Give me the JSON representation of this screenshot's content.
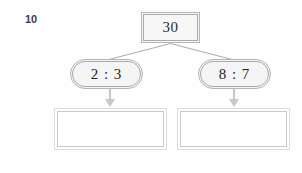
{
  "page": {
    "background_color": "#fefefe",
    "question_number": "10"
  },
  "diagram": {
    "type": "ratio-split-tree",
    "total_node": {
      "label": "30",
      "shape": "rectangle",
      "fill_color": "#f7f7f7",
      "border_color": "#b6b6b6"
    },
    "branches": [
      {
        "id": "left",
        "ratio_label": "2 : 3",
        "shape": "rounded-pill",
        "fill_color": "#f5f5f5",
        "border_color": "#b4b4b4",
        "arrow": "down-arrow-icon",
        "arrow_color": "#c8c8c8",
        "answer_label": "",
        "answer_placeholder": ""
      },
      {
        "id": "right",
        "ratio_label": "8 : 7",
        "shape": "rounded-pill",
        "fill_color": "#f5f5f5",
        "border_color": "#b4b4b4",
        "arrow": "down-arrow-icon",
        "arrow_color": "#c8c8c8",
        "answer_label": "",
        "answer_placeholder": ""
      }
    ],
    "connector_color": "#a9a9a9"
  }
}
